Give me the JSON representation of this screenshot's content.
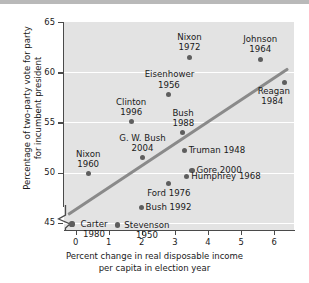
{
  "chart_data": {
    "type": "scatter",
    "title": "",
    "xlabel": "Percent change in real disposable income\nper capita in election year",
    "ylabel": "Percentage of two-party vote for party\nfor incumbent president",
    "xlim": [
      -0.35,
      6.6
    ],
    "ylim": [
      44.3,
      65
    ],
    "xticks": [
      0,
      1,
      2,
      3,
      4,
      5,
      6
    ],
    "yticks": [
      45,
      50,
      55,
      60,
      65
    ],
    "xtick_labels": [
      "0",
      "1",
      "2",
      "3",
      "4",
      "5",
      "6"
    ],
    "ytick_labels": [
      "45",
      "50",
      "55",
      "60",
      "65"
    ],
    "grid": "horizontal-white-gridlines",
    "axis_break": "y-axis broken below 45",
    "legend": "none",
    "marker_color": "#5e5e5e",
    "trend_color": "#8a8a8a",
    "plot_background": "#e3e3e3",
    "points": [
      {
        "label": "Nixon\n1972",
        "x": 3.44,
        "y": 61.5,
        "lbl_pos": "above",
        "align": "c"
      },
      {
        "label": "Johnson\n1964",
        "x": 5.58,
        "y": 61.3,
        "lbl_pos": "above",
        "align": "c"
      },
      {
        "label": "Reagan\n1984",
        "x": 6.32,
        "y": 59.0,
        "lbl_pos": "below-left",
        "align": "c"
      },
      {
        "label": "Eisenhower\n1956",
        "x": 2.82,
        "y": 57.8,
        "lbl_pos": "above",
        "align": "c"
      },
      {
        "label": "Clinton\n1996",
        "x": 1.68,
        "y": 55.1,
        "lbl_pos": "above",
        "align": "c"
      },
      {
        "label": "Bush\n1988",
        "x": 3.22,
        "y": 54.0,
        "lbl_pos": "above",
        "align": "c"
      },
      {
        "label": "G. W. Bush\n2004",
        "x": 2.02,
        "y": 51.5,
        "lbl_pos": "above",
        "align": "c"
      },
      {
        "label": "Truman 1948",
        "x": 3.28,
        "y": 52.2,
        "lbl_pos": "right",
        "align": "l"
      },
      {
        "label": "Gore 2000",
        "x": 3.52,
        "y": 50.2,
        "lbl_pos": "right",
        "align": "l"
      },
      {
        "label": "Nixon\n1960",
        "x": 0.38,
        "y": 49.9,
        "lbl_pos": "above",
        "align": "c"
      },
      {
        "label": "Humphrey 1968",
        "x": 3.36,
        "y": 49.6,
        "lbl_pos": "right",
        "align": "l"
      },
      {
        "label": "Ford 1976",
        "x": 2.82,
        "y": 48.9,
        "lbl_pos": "below",
        "align": "c"
      },
      {
        "label": "Bush 1992",
        "x": 1.98,
        "y": 46.5,
        "lbl_pos": "right",
        "align": "l"
      },
      {
        "label": "Carter\n1980",
        "x": -0.11,
        "y": 44.9,
        "lbl_pos": "right",
        "align": "c"
      },
      {
        "label": "Stevenson\n1950",
        "x": 1.27,
        "y": 44.8,
        "lbl_pos": "right",
        "align": "c"
      }
    ],
    "trend_line": {
      "x1": -0.22,
      "y1": 45.85,
      "x2": 6.42,
      "y2": 60.35
    }
  }
}
